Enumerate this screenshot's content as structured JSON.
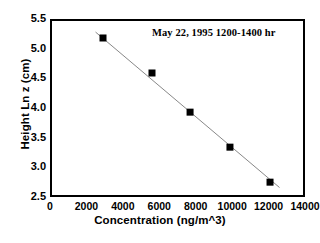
{
  "chart_data": {
    "type": "scatter",
    "title": "",
    "subtitle": "",
    "annotation": "May 22, 1995 1200-1400 hr",
    "xlabel": "Concentration (ng/m^3)",
    "ylabel": "Height Ln z (cm)",
    "xlim": [
      0,
      14000
    ],
    "ylim": [
      2.5,
      5.5
    ],
    "xticks": [
      0,
      2000,
      4000,
      6000,
      8000,
      10000,
      12000,
      14000
    ],
    "xtick_labels": [
      "0",
      "2000",
      "4000",
      "6000",
      "8000",
      "10000",
      "12000",
      "14000"
    ],
    "yticks": [
      2.5,
      3.0,
      3.5,
      4.0,
      4.5,
      5.0,
      5.5
    ],
    "ytick_labels": [
      "2.5",
      "3.0",
      "3.5",
      "4.0",
      "4.5",
      "5.0",
      "5.5"
    ],
    "grid": false,
    "legend": false,
    "marker": "square",
    "marker_color": "#000000",
    "line_color": "#888888",
    "frame_color": "#000000",
    "series": [
      {
        "name": "Height vs Concentration",
        "x": [
          2910,
          5600,
          7690,
          9880,
          12080
        ],
        "y": [
          5.18,
          4.59,
          3.93,
          3.34,
          2.75
        ]
      }
    ],
    "fit_line": {
      "x": [
        2500,
        12600
      ],
      "y": [
        5.28,
        2.66
      ]
    }
  }
}
